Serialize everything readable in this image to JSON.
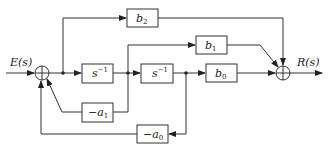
{
  "diagram": {
    "type": "block-diagram",
    "input": {
      "label": "E(s)"
    },
    "output": {
      "label": "R(s)"
    },
    "blocks": [
      {
        "id": "b2",
        "base": "b",
        "sub": "2"
      },
      {
        "id": "b1",
        "base": "b",
        "sub": "1"
      },
      {
        "id": "b0",
        "base": "b",
        "sub": "0"
      },
      {
        "id": "int1",
        "base": "s",
        "sup": "−1"
      },
      {
        "id": "int2",
        "base": "s",
        "sup": "−1"
      },
      {
        "id": "neg_a1",
        "base": "−a",
        "sub": "1"
      },
      {
        "id": "neg_a0",
        "base": "−a",
        "sub": "0"
      }
    ],
    "summing_junctions": [
      {
        "id": "input_sum",
        "inputs": [
          "E(s)",
          "−a1 feedback",
          "−a0 feedback"
        ]
      },
      {
        "id": "output_sum",
        "inputs": [
          "b2 path",
          "b1 path",
          "b0 path"
        ],
        "output": "R(s)"
      }
    ],
    "connections": [
      "E(s) → input_sum",
      "input_sum → int1",
      "input_sum → b2 → output_sum",
      "int1 → int2",
      "int1 → b1 → output_sum",
      "int1 → −a1 → input_sum",
      "int2 → b0 → output_sum",
      "int2 → −a0 → input_sum",
      "output_sum → R(s)"
    ]
  }
}
